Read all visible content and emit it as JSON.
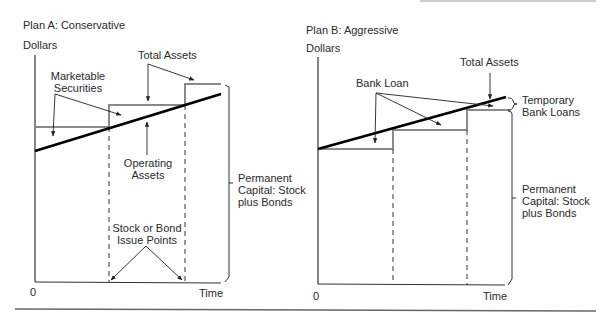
{
  "panels": [
    {
      "title": "Plan A: Conservative",
      "y_axis_label": "Dollars",
      "x_axis_origin": "0",
      "x_axis_label": "Time",
      "labels": {
        "total_assets": "Total Assets",
        "marketable_securities_1": "Marketable",
        "marketable_securities_2": "Securities",
        "operating_assets_1": "Operating",
        "operating_assets_2": "Assets",
        "issue_points_1": "Stock or Bond",
        "issue_points_2": "Issue Points",
        "permanent_capital_1": "Permanent",
        "permanent_capital_2": "Capital: Stock",
        "permanent_capital_3": "plus Bonds"
      }
    },
    {
      "title": "Plan B: Aggressive",
      "y_axis_label": "Dollars",
      "x_axis_origin": "0",
      "x_axis_label": "Time",
      "labels": {
        "total_assets": "Total Assets",
        "bank_loan": "Bank Loan",
        "temporary_bank_loans_1": "Temporary",
        "temporary_bank_loans_2": "Bank Loans",
        "permanent_capital_1": "Permanent",
        "permanent_capital_2": "Capital: Stock",
        "permanent_capital_3": "plus Bonds"
      }
    }
  ],
  "colors": {
    "total_assets_line": "#000000",
    "permanent_capital_steps": "#8a8a8a",
    "axes": "#333333"
  }
}
